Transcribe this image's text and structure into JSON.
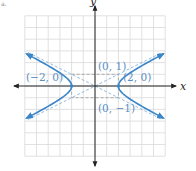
{
  "chart_data": {
    "type": "line",
    "title": "",
    "xlabel": "x",
    "ylabel": "y",
    "xlim": [
      -6,
      6
    ],
    "ylim": [
      -6,
      6
    ],
    "grid": true,
    "equation": "x^2/4 - y^2 = 1",
    "series": [
      {
        "name": "hyperbola-right-branch",
        "color": "#3a86c8",
        "style": "solid",
        "vertex": [
          2,
          0
        ]
      },
      {
        "name": "hyperbola-left-branch",
        "color": "#3a86c8",
        "style": "solid",
        "vertex": [
          -2,
          0
        ]
      },
      {
        "name": "asymptote-positive",
        "equation": "y = x/2",
        "color": "#7aa9d6",
        "style": "dashed"
      },
      {
        "name": "asymptote-negative",
        "equation": "y = -x/2",
        "color": "#7aa9d6",
        "style": "dashed"
      },
      {
        "name": "central-rectangle",
        "corners": [
          [
            -2,
            -1
          ],
          [
            2,
            -1
          ],
          [
            2,
            1
          ],
          [
            -2,
            1
          ]
        ],
        "color": "#9a9a9a",
        "style": "dashed"
      }
    ],
    "points": [
      {
        "label": "(−2, 0)",
        "x": -2,
        "y": 0
      },
      {
        "label": "(2, 0)",
        "x": 2,
        "y": 0
      },
      {
        "label": "(0, 1)",
        "x": 0,
        "y": 1
      },
      {
        "label": "(0, −1)",
        "x": 0,
        "y": -1
      }
    ],
    "annotations": [
      "(−2, 0)",
      "(2, 0)",
      "(0, 1)",
      "(0, −1)"
    ]
  },
  "labels": {
    "x_axis": "x",
    "y_axis": "y",
    "left_vertex": "(−2, 0)",
    "right_vertex": "(2, 0)",
    "top_covertex": "(0, 1)",
    "bottom_covertex": "(0, −1)",
    "corner_mark": "a."
  },
  "colors": {
    "curve": "#3a86c8",
    "label": "#5a8ec4",
    "grid": "#d9d9d9",
    "axis": "#222222"
  }
}
